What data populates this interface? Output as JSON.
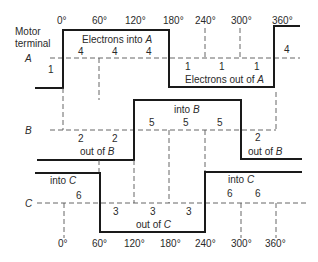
{
  "header": {
    "title_line1": "Motor",
    "title_line2": "terminal"
  },
  "top_axis": [
    "0°",
    "60°",
    "120°",
    "180°",
    "240°",
    "300°",
    "360°"
  ],
  "bottom_axis": [
    "0°",
    "60°",
    "120°",
    "180°",
    "240°",
    "300°",
    "360°"
  ],
  "terminals": {
    "A": {
      "label": "A",
      "into_label": "Electrons into ",
      "into_term": "A",
      "out_label": "Electrons out of ",
      "out_term": "A",
      "step_labels": [
        "1",
        "4",
        "4",
        "4",
        "1",
        "1",
        "1",
        "4"
      ]
    },
    "B": {
      "label": "B",
      "into_label": "into ",
      "into_term": "B",
      "out_label": "out of ",
      "out_term": "B",
      "step_labels": [
        "2",
        "2",
        "5",
        "5",
        "5",
        "2"
      ]
    },
    "C": {
      "label": "C",
      "into_label": "into ",
      "into_term": "C",
      "out_label": "out of ",
      "out_term": "C",
      "step_labels": [
        "6",
        "3",
        "3",
        "3",
        "6",
        "6"
      ]
    }
  }
}
